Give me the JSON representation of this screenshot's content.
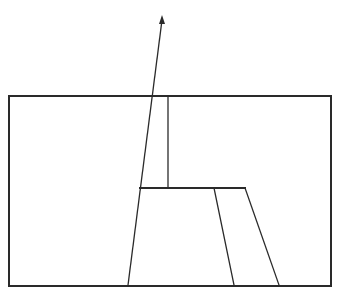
{
  "diagram": {
    "width": 343,
    "height": 300,
    "background": "#ffffff",
    "stroke_color": "#2a2a2a",
    "frame": {
      "x": 9,
      "y": 96,
      "width": 322,
      "height": 190,
      "stroke_width": 2
    },
    "lines": [
      {
        "id": "arrow-shaft",
        "x1": 128,
        "y1": 285,
        "x2": 162,
        "y2": 20,
        "stroke_width": 1.3
      },
      {
        "id": "vertical-line",
        "x1": 168,
        "y1": 96,
        "x2": 168,
        "y2": 188,
        "stroke_width": 1.3
      },
      {
        "id": "horizontal-shelf",
        "x1": 140,
        "y1": 188,
        "x2": 245,
        "y2": 188,
        "stroke_width": 2
      },
      {
        "id": "inner-slant",
        "x1": 214,
        "y1": 188,
        "x2": 234,
        "y2": 285,
        "stroke_width": 1.3
      },
      {
        "id": "outer-slant",
        "x1": 245,
        "y1": 188,
        "x2": 279,
        "y2": 285,
        "stroke_width": 1.3
      }
    ],
    "arrowhead": {
      "tip_x": 162,
      "tip_y": 15,
      "points": "162,15 159,24 165,24"
    }
  }
}
